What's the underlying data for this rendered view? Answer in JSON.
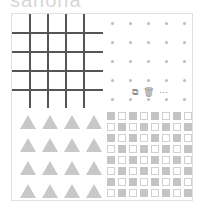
{
  "heading": {
    "text": "sanona"
  },
  "card": {
    "tiles": [
      {
        "name": "grid",
        "description": "square grid lines"
      },
      {
        "name": "dots",
        "description": "5x5 dot grid"
      },
      {
        "name": "triangles",
        "description": "4x4 triangles"
      },
      {
        "name": "checkerboard",
        "description": "8x8 alternating filled/outlined squares"
      }
    ]
  },
  "toolbar": {
    "icons": [
      {
        "name": "copy-icon",
        "glyph": "⧉"
      },
      {
        "name": "trash-icon",
        "glyph": "🗑"
      },
      {
        "name": "more-icon",
        "glyph": "···"
      }
    ]
  },
  "colors": {
    "grid_line": "#555555",
    "dot": "#bbbbbb",
    "triangle": "#c8c8c8",
    "check_fill": "#c4c4c4",
    "border": "#e0e0e0"
  }
}
